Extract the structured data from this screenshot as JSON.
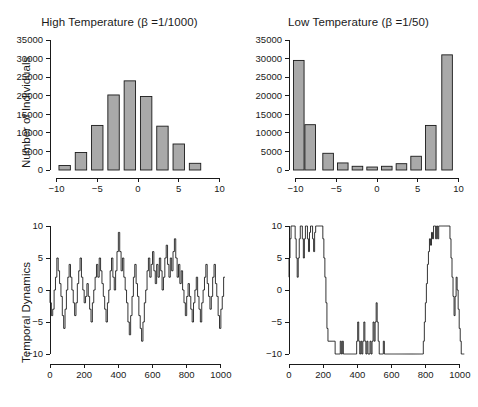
{
  "figure": {
    "background": "#ffffff",
    "bar_fill": "#a9a9a9",
    "bar_stroke": "#1a1a1a",
    "line_color": "#111111"
  },
  "panels": {
    "hist_high": {
      "title": "High Temperature (β =1/1000)",
      "ylabel": "Number of Individuals"
    },
    "hist_low": {
      "title": "Low Temperature (β =1/50)"
    },
    "ts_high": {
      "ylabel": "Temporal Dynamics"
    }
  },
  "chart_data": [
    {
      "type": "bar",
      "title": "High Temperature (β =1/1000)",
      "xlabel": "",
      "ylabel": "Number of Individuals",
      "categories": [
        -9,
        -7,
        -5,
        -3,
        -1,
        1,
        3,
        5,
        7
      ],
      "values": [
        1200,
        4700,
        12000,
        20200,
        24000,
        19800,
        11800,
        7000,
        1800
      ],
      "bar_width": 1.4,
      "xlim": [
        -10.8,
        10.8
      ],
      "ylim": [
        0,
        35000
      ],
      "xticks": [
        -10,
        -5,
        0,
        5,
        10
      ],
      "yticks": [
        0,
        5000,
        10000,
        15000,
        20000,
        25000,
        30000,
        35000
      ],
      "ytick_labels": [
        "0",
        "5000",
        "10000",
        "15000",
        "20000",
        "25000",
        "30000",
        "35000"
      ],
      "grid": false,
      "legend": "none"
    },
    {
      "type": "bar",
      "title": "Low Temperature (β =1/50)",
      "xlabel": "",
      "ylabel": "Number of Individuals",
      "categories": [
        -9.6,
        -8.2,
        -6,
        -4.2,
        -2.4,
        -0.6,
        1.2,
        3,
        4.8,
        6.6,
        8.6
      ],
      "values": [
        29500,
        12200,
        4500,
        1900,
        1000,
        800,
        1000,
        1700,
        3700,
        12000,
        31000
      ],
      "bar_width": 1.3,
      "xlim": [
        -10.8,
        10.8
      ],
      "ylim": [
        0,
        35000
      ],
      "xticks": [
        -10,
        -5,
        0,
        5,
        10
      ],
      "yticks": [
        0,
        5000,
        10000,
        15000,
        20000,
        25000,
        30000,
        35000
      ],
      "ytick_labels": [
        "0",
        "5000",
        "10000",
        "15000",
        "20000",
        "25000",
        "30000",
        "35000"
      ],
      "grid": false,
      "legend": "none"
    },
    {
      "type": "line",
      "title": "",
      "xlabel": "",
      "ylabel": "Temporal Dynamics",
      "xlim": [
        0,
        1030
      ],
      "ylim": [
        -10,
        10
      ],
      "xticks": [
        0,
        200,
        400,
        600,
        800,
        1000
      ],
      "yticks": [
        -10,
        -5,
        0,
        5,
        10
      ],
      "grid": false,
      "legend": "none",
      "series": [
        {
          "name": "high-temperature-trajectory",
          "x": [
            0,
            8,
            16,
            24,
            32,
            40,
            48,
            56,
            64,
            72,
            80,
            88,
            96,
            104,
            112,
            120,
            128,
            136,
            144,
            152,
            160,
            168,
            176,
            184,
            192,
            200,
            208,
            216,
            224,
            232,
            240,
            248,
            256,
            264,
            272,
            280,
            288,
            296,
            304,
            312,
            320,
            328,
            336,
            344,
            352,
            360,
            368,
            376,
            384,
            392,
            400,
            408,
            416,
            424,
            432,
            440,
            448,
            456,
            464,
            472,
            480,
            488,
            496,
            504,
            512,
            520,
            528,
            536,
            544,
            552,
            560,
            568,
            576,
            584,
            592,
            600,
            608,
            616,
            624,
            632,
            640,
            648,
            656,
            664,
            672,
            680,
            688,
            696,
            704,
            712,
            720,
            728,
            736,
            744,
            752,
            760,
            768,
            776,
            784,
            792,
            800,
            808,
            816,
            824,
            832,
            840,
            848,
            856,
            864,
            872,
            880,
            888,
            896,
            904,
            912,
            920,
            928,
            936,
            944,
            952,
            960,
            968,
            976,
            984,
            992,
            1000,
            1008,
            1016,
            1024
          ],
          "y": [
            0,
            -2,
            -4,
            -3,
            0,
            2,
            5,
            3,
            1,
            -1,
            -4,
            -6,
            -3,
            0,
            2,
            4,
            2,
            0,
            -2,
            -4,
            -2,
            1,
            3,
            5,
            2,
            0,
            -2,
            -1,
            1,
            -1,
            -3,
            -5,
            -2,
            0,
            2,
            4,
            2,
            5,
            3,
            1,
            -1,
            -3,
            -5,
            -2,
            0,
            3,
            5,
            2,
            0,
            3,
            6,
            9,
            6,
            3,
            5,
            2,
            0,
            -2,
            -5,
            -7,
            -4,
            -1,
            2,
            4,
            1,
            -1,
            -4,
            -6,
            -8,
            -5,
            -2,
            0,
            3,
            5,
            2,
            4,
            6,
            3,
            1,
            4,
            2,
            5,
            3,
            0,
            2,
            5,
            7,
            4,
            2,
            5,
            3,
            6,
            8,
            5,
            2,
            4,
            1,
            3,
            0,
            -2,
            -4,
            -1,
            1,
            -1,
            -3,
            -5,
            -2,
            0,
            2,
            -1,
            -3,
            -5,
            -2,
            0,
            2,
            4,
            1,
            -1,
            -3,
            -1,
            2,
            4,
            1,
            -1,
            -4,
            -6,
            -3,
            -1,
            2,
            5,
            2,
            -1,
            -4,
            -7,
            -4,
            -1,
            2
          ]
        }
      ]
    },
    {
      "type": "line",
      "title": "",
      "xlabel": "",
      "ylabel": "Temporal Dynamics",
      "xlim": [
        0,
        1030
      ],
      "ylim": [
        -10,
        10
      ],
      "xticks": [
        0,
        200,
        400,
        600,
        800,
        1000
      ],
      "yticks": [
        -10,
        -5,
        0,
        5,
        10
      ],
      "grid": false,
      "legend": "none",
      "series": [
        {
          "name": "low-temperature-trajectory",
          "x": [
            0,
            6,
            12,
            18,
            24,
            30,
            36,
            42,
            48,
            54,
            60,
            66,
            72,
            78,
            84,
            90,
            96,
            102,
            108,
            114,
            120,
            126,
            132,
            138,
            144,
            150,
            156,
            162,
            168,
            174,
            180,
            186,
            192,
            198,
            204,
            210,
            216,
            222,
            228,
            234,
            240,
            246,
            252,
            258,
            264,
            270,
            276,
            282,
            288,
            294,
            300,
            306,
            312,
            318,
            324,
            330,
            336,
            342,
            348,
            354,
            360,
            366,
            372,
            378,
            384,
            390,
            396,
            402,
            408,
            414,
            420,
            426,
            432,
            438,
            444,
            450,
            456,
            462,
            468,
            474,
            480,
            486,
            492,
            498,
            504,
            510,
            516,
            522,
            528,
            534,
            540,
            546,
            552,
            558,
            564,
            570,
            576,
            582,
            588,
            594,
            600,
            606,
            612,
            618,
            624,
            630,
            636,
            642,
            648,
            654,
            660,
            666,
            672,
            678,
            684,
            690,
            696,
            702,
            708,
            714,
            720,
            726,
            732,
            738,
            744,
            750,
            756,
            762,
            768,
            774,
            780,
            786,
            792,
            798,
            804,
            810,
            816,
            822,
            828,
            834,
            840,
            846,
            852,
            858,
            864,
            870,
            876,
            882,
            888,
            894,
            900,
            906,
            912,
            918,
            924,
            930,
            936,
            942,
            948,
            954,
            960,
            966,
            972,
            978,
            984,
            990,
            996,
            1002,
            1008,
            1014,
            1020,
            1026
          ],
          "y": [
            2,
            5,
            8,
            10,
            10,
            10,
            10,
            8,
            5,
            2,
            5,
            8,
            10,
            10,
            8,
            5,
            8,
            10,
            10,
            8,
            6,
            9,
            10,
            10,
            8,
            6,
            9,
            10,
            10,
            10,
            10,
            10,
            10,
            10,
            8,
            5,
            2,
            -2,
            -6,
            -8,
            -8,
            -8,
            -8,
            -8,
            -8,
            -8,
            -10,
            -10,
            -10,
            -10,
            -10,
            -8,
            -10,
            -8,
            -10,
            -10,
            -10,
            -10,
            -10,
            -10,
            -10,
            -10,
            -10,
            -10,
            -10,
            -10,
            -10,
            -8,
            -5,
            -8,
            -10,
            -8,
            -10,
            -8,
            -5,
            -8,
            -10,
            -8,
            -10,
            -10,
            -8,
            -10,
            -8,
            -5,
            -8,
            -5,
            -2,
            -5,
            -8,
            -10,
            -10,
            -10,
            -10,
            -8,
            -10,
            -10,
            -10,
            -10,
            -10,
            -10,
            -10,
            -10,
            -10,
            -10,
            -10,
            -10,
            -10,
            -10,
            -10,
            -10,
            -10,
            -10,
            -10,
            -10,
            -10,
            -10,
            -10,
            -10,
            -10,
            -10,
            -10,
            -10,
            -10,
            -10,
            -10,
            -10,
            -10,
            -10,
            -10,
            -10,
            -10,
            -10,
            -8,
            -5,
            -2,
            1,
            4,
            6,
            8,
            7,
            9,
            8,
            10,
            10,
            8,
            10,
            8,
            10,
            10,
            10,
            10,
            10,
            10,
            10,
            10,
            10,
            10,
            10,
            8,
            5,
            2,
            -1,
            -4,
            -1,
            2,
            0,
            -3,
            -6,
            -8,
            -10,
            -10,
            -10
          ]
        }
      ]
    }
  ]
}
